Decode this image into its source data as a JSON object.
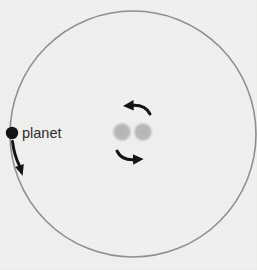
{
  "figure": {
    "kind": "orbital-schematic",
    "background_color": "#f2f2f1",
    "width": 257,
    "height": 270
  },
  "orbit": {
    "name": "planet-orbit-circle",
    "center_x": 133,
    "center_y": 134,
    "radius": 123,
    "stroke_color": "#8f8f8f",
    "stroke_width": 1.6,
    "fill": "none"
  },
  "planet": {
    "label": "planet",
    "dot_x": 12,
    "dot_y": 133,
    "dot_radius": 6.2,
    "dot_color": "#111111",
    "label_x": 22,
    "label_y": 138,
    "label_color": "#2a2a2a"
  },
  "planet_direction_arrow": {
    "name": "planet-orbit-direction-arrow",
    "description": "curved arrow below the planet indicating direction of travel along the orbit",
    "color": "#111111",
    "points_toward": "down"
  },
  "binary_pair": {
    "name": "central-binary-stars",
    "star_color": "#b9b9b9",
    "stars": [
      {
        "name": "star-left",
        "cx": 122,
        "cy": 132,
        "r": 10.2
      },
      {
        "name": "star-right",
        "cx": 143,
        "cy": 132,
        "r": 10.2
      }
    ]
  },
  "rotation_arrows": {
    "color": "#111111",
    "sense": "counterclockwise",
    "top": {
      "name": "binary-rotation-arrow-top",
      "points_toward": "left"
    },
    "bottom": {
      "name": "binary-rotation-arrow-bottom",
      "points_toward": "right"
    }
  }
}
